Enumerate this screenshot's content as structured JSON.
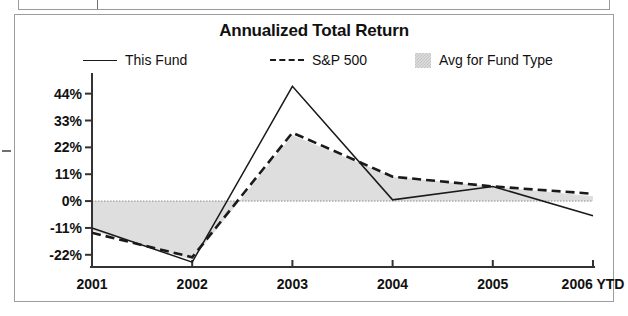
{
  "chart_data": {
    "type": "line",
    "title": "Annualized Total Return",
    "xlabel": "",
    "ylabel": "",
    "categories": [
      "2001",
      "2002",
      "2003",
      "2004",
      "2005",
      "2006 YTD"
    ],
    "ytick_labels": [
      "44%",
      "33%",
      "22%",
      "11%",
      "0%",
      "-11%",
      "-22%"
    ],
    "ytick_values": [
      44,
      33,
      22,
      11,
      0,
      -11,
      -22
    ],
    "ylim": [
      -27,
      50
    ],
    "grid": false,
    "zero_line": true,
    "legend_position": "top",
    "series": [
      {
        "name": "This Fund",
        "style": "solid",
        "color": "#1a1a1a",
        "values": [
          -11,
          -25,
          47,
          0.5,
          6,
          -6
        ]
      },
      {
        "name": "S&P 500",
        "style": "dashed",
        "color": "#1a1a1a",
        "values": [
          -13,
          -23,
          28,
          10,
          6,
          3
        ]
      },
      {
        "name": "Avg for Fund Type",
        "style": "shaded-area",
        "color": "#dcdcdc",
        "values": [
          -12,
          -24,
          27,
          10,
          6,
          2
        ]
      }
    ]
  },
  "chart": {
    "title": "Annualized Total Return",
    "legend": [
      {
        "label": "This Fund",
        "marker": "solid-line-swatch"
      },
      {
        "label": "S&P 500",
        "marker": "dashed-line-swatch"
      },
      {
        "label": "Avg for Fund Type",
        "marker": "shaded-box-swatch"
      }
    ]
  },
  "colors": {
    "line": "#1a1a1a",
    "area_fill": "#dcdcdc",
    "axis": "#333333",
    "frame": "#9d9d9d"
  }
}
